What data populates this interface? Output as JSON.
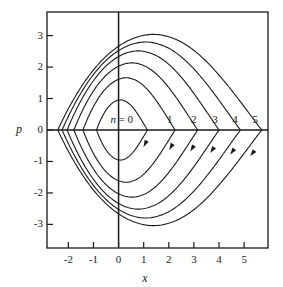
{
  "figure": {
    "name": "phase-space-contour-plot",
    "background": "#ffffff",
    "ink": "#1a1a1a"
  },
  "axes": {
    "x_title": "x",
    "y_title": "p",
    "x_ticks": [
      "-2",
      "-1",
      "0",
      "1",
      "2",
      "3",
      "4",
      "5"
    ],
    "x_tick_values": [
      -2,
      -1,
      0,
      1,
      2,
      3,
      4,
      5
    ],
    "y_ticks": [
      "3",
      "2",
      "1",
      "0",
      "-1",
      "-2",
      "-3"
    ],
    "y_tick_values": [
      3,
      2,
      1,
      0,
      -1,
      -2,
      -3
    ],
    "xlim": [
      -2.85,
      5.95
    ],
    "ylim": [
      -3.75,
      3.75
    ],
    "frame": true,
    "grid": false
  },
  "curve_labels": [
    {
      "text_prefix": "n",
      "text_eq": " = ",
      "text": "0",
      "x": 0.55,
      "y": 0.3
    },
    {
      "text": "1",
      "x": 2.05,
      "y": 0.3
    },
    {
      "text": "2",
      "x": 3.0,
      "y": 0.3
    },
    {
      "text": "3",
      "x": 3.85,
      "y": 0.3
    },
    {
      "text": "4",
      "x": 4.65,
      "y": 0.3
    },
    {
      "text": "5",
      "x": 5.45,
      "y": 0.3
    }
  ],
  "chart_data": {
    "type": "line",
    "title": "",
    "xlabel": "x",
    "ylabel": "p",
    "xlim": [
      -2.85,
      5.95
    ],
    "ylim": [
      -3.75,
      3.75
    ],
    "grid": false,
    "legend": "inline curve labels n = 0 .. 5",
    "orbit_direction": "clockwise",
    "series": [
      {
        "name": "n = 0",
        "label": "0",
        "p_max": 0.95,
        "p_min": -0.95,
        "x_max": 1.15,
        "x_min": -0.88,
        "label_x": 0.55,
        "label_y": 0.3,
        "arrow_x": 1.05,
        "arrow_y": -0.45
      },
      {
        "name": "n = 1",
        "label": "1",
        "p_max": 1.65,
        "p_min": -1.65,
        "x_max": 2.25,
        "x_min": -1.42,
        "label_x": 2.05,
        "label_y": 0.3,
        "arrow_x": 2.08,
        "arrow_y": -0.55
      },
      {
        "name": "n = 2",
        "label": "2",
        "p_max": 2.12,
        "p_min": -2.12,
        "x_max": 3.15,
        "x_min": -1.78,
        "label_x": 3.0,
        "label_y": 0.3,
        "arrow_x": 2.92,
        "arrow_y": -0.6
      },
      {
        "name": "n = 3",
        "label": "3",
        "p_max": 2.5,
        "p_min": -2.5,
        "x_max": 4.0,
        "x_min": -2.05,
        "label_x": 3.85,
        "label_y": 0.3,
        "arrow_x": 3.72,
        "arrow_y": -0.65
      },
      {
        "name": "n = 4",
        "label": "4",
        "p_max": 2.78,
        "p_min": -2.78,
        "x_max": 4.85,
        "x_min": -2.25,
        "label_x": 4.65,
        "label_y": 0.3,
        "arrow_x": 4.52,
        "arrow_y": -0.7
      },
      {
        "name": "n = 5",
        "label": "5",
        "p_max": 3.02,
        "p_min": -3.02,
        "x_max": 5.7,
        "x_min": -2.42,
        "label_x": 5.45,
        "label_y": 0.3,
        "arrow_x": 5.32,
        "arrow_y": -0.75
      }
    ]
  }
}
